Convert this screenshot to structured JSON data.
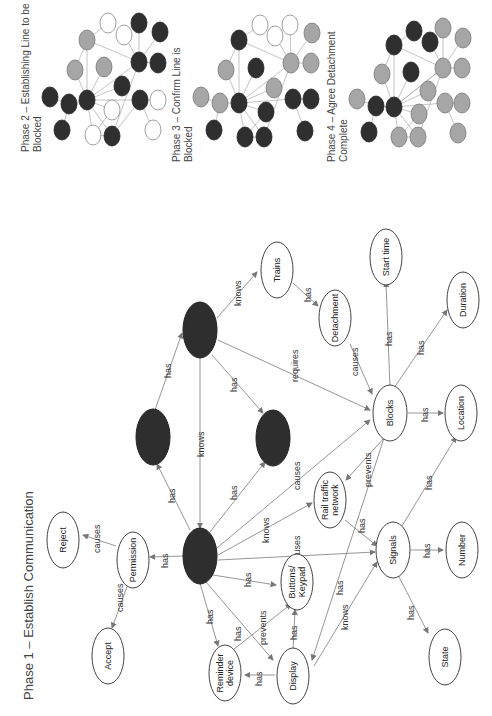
{
  "phases": {
    "phase1": {
      "title": "Phase 1 – Establish Communication"
    },
    "phase2": {
      "title_line1": "Phase 2 – Establishing Line to be",
      "title_line2": "Blocked"
    },
    "phase3": {
      "title_line1": "Phase 3 – Confirm Line is",
      "title_line2": "Blocked"
    },
    "phase4": {
      "title_line1": "Phase 4 – Agree Detachment",
      "title_line2": "Complete"
    }
  },
  "nodes": {
    "reject": "Reject",
    "permission": "Permission",
    "accept": "Accept",
    "trains": "Trains",
    "detachment": "Detachment",
    "start_time": "Start time",
    "duration": "Duration",
    "blocks": "Blocks",
    "location": "Location",
    "rail_traffic_network_1": "Rail traffic",
    "rail_traffic_network_2": "network",
    "signals": "Signals",
    "number": "Number",
    "state": "State",
    "buttons_keypad_1": "Buttons/",
    "buttons_keypad_2": "Keypad",
    "display": "Display",
    "reminder_device_1": "Reminder",
    "reminder_device_2": "device"
  },
  "edges": {
    "causes": "causes",
    "has": "has",
    "knows": "knows",
    "requires": "requires",
    "prevents": "prevents"
  },
  "legend_colors": {
    "dark_node": "#2e2e2e",
    "grey_node": "#a6a6a6",
    "light_node": "#ffffff",
    "edge": "#8a8a8a"
  }
}
